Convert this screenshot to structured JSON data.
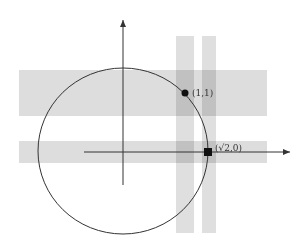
{
  "diagram": {
    "title": "",
    "colors": {
      "background": "#ffffff",
      "band": "#d9d9d9",
      "band_overlap": "#c8c8c8",
      "stroke": "#333333",
      "marker": "#111111"
    },
    "axes": {
      "x_axis": {
        "x1": 84,
        "y1": 152,
        "x2": 290,
        "y2": 152,
        "arrow": true
      },
      "y_axis": {
        "x1": 123,
        "y1": 185,
        "x2": 123,
        "y2": 20,
        "arrow": true
      }
    },
    "circle": {
      "cx": 123,
      "cy": 151,
      "rx": 85,
      "ry": 83
    },
    "bands": {
      "horizontal": [
        {
          "x": 19,
          "y": 70,
          "width": 248,
          "height": 46
        },
        {
          "x": 19,
          "y": 141,
          "width": 248,
          "height": 22
        }
      ],
      "vertical": [
        {
          "x": 176,
          "y": 36,
          "width": 18,
          "height": 197
        },
        {
          "x": 202,
          "y": 36,
          "width": 14,
          "height": 197
        }
      ]
    },
    "points": [
      {
        "name": "point-1-1",
        "shape": "circle",
        "x": 185,
        "y": 93,
        "label": "(1,1)",
        "label_x": 192,
        "label_y": 93
      },
      {
        "name": "point-sqrt2-0",
        "shape": "square",
        "x": 208,
        "y": 152,
        "label": "(√2,0)",
        "label_x": 215,
        "label_y": 148
      }
    ]
  }
}
